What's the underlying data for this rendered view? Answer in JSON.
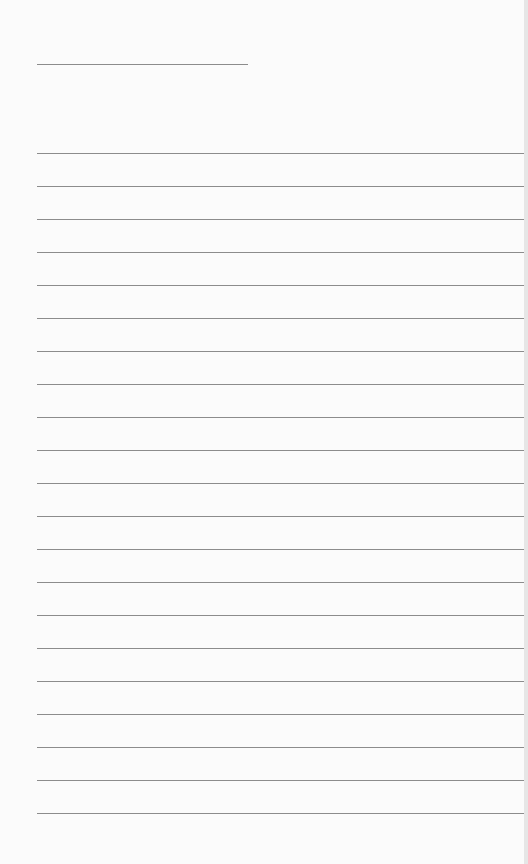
{
  "page": {
    "type": "lined-paper",
    "background": "#fbfbfb",
    "line_color": "#8c8c8c",
    "header_line": {
      "y": 64,
      "x_start": 37,
      "x_end": 248
    },
    "ruled_lines": {
      "x_start": 37,
      "x_end": 524,
      "first_y": 153,
      "spacing": 33,
      "count": 21
    }
  }
}
